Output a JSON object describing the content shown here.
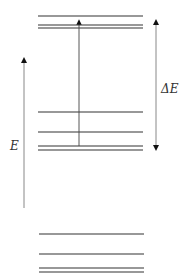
{
  "diagram": {
    "type": "energy-level-diagram",
    "axis_label": "E",
    "gap_label": "ΔE",
    "line_color": "#333333",
    "arrow_color": "#555555",
    "levels": {
      "upper_group": [
        16,
        25,
        28
      ],
      "middle_group": [
        112,
        132,
        146,
        150
      ],
      "lower_group": [
        234,
        254,
        268,
        272
      ]
    },
    "transition_arrow": {
      "from_y": 146,
      "to_y": 18,
      "x": 79
    },
    "energy_axis": {
      "from_y": 208,
      "to_y": 56,
      "x": 24
    },
    "gap_arrow": {
      "from_y": 18,
      "to_y": 152,
      "x": 156
    }
  }
}
